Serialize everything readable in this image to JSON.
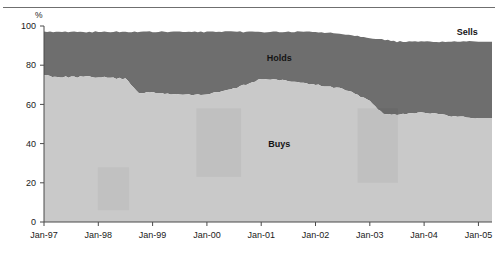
{
  "chart_data": {
    "type": "area",
    "stacked": true,
    "title": "",
    "subtitle": "",
    "xlabel": "",
    "ylabel": "",
    "yunit": "%",
    "ylim": [
      0,
      100
    ],
    "yticks": [
      0,
      20,
      40,
      60,
      80,
      100
    ],
    "ytick_labels": [
      "0",
      "20",
      "40",
      "60",
      "80",
      "100"
    ],
    "grid": false,
    "legend_position": "inline-annotations",
    "x": [
      "Jan-97",
      "Jul-97",
      "Jan-98",
      "Jul-98",
      "Jan-99",
      "Jul-99",
      "Jan-00",
      "Jul-00",
      "Jan-01",
      "Jul-01",
      "Jan-02",
      "Jul-02",
      "Jan-03",
      "Jul-03",
      "Jan-04",
      "Jul-04",
      "Jan-05"
    ],
    "xtick_labels": [
      "Jan-97",
      "Jan-98",
      "Jan-99",
      "Jan-00",
      "Jan-01",
      "Jan-02",
      "Jan-03",
      "Jan-04",
      "Jan-05"
    ],
    "series": [
      {
        "name": "Buys",
        "color": "#c9c9c9",
        "label": "Buys",
        "values": [
          75,
          74,
          74,
          73,
          66,
          65,
          65,
          68,
          73,
          72,
          70,
          68,
          62,
          55,
          56,
          54,
          53
        ]
      },
      {
        "name": "Holds",
        "color": "#6e6e6e",
        "label": "Holds",
        "values": [
          22,
          23,
          23,
          24,
          31,
          32,
          32,
          29,
          24,
          25,
          27,
          28,
          32,
          37,
          36,
          38,
          39
        ]
      },
      {
        "name": "Sells",
        "color": "#ffffff",
        "label": "Sells",
        "values": [
          3,
          3,
          3,
          3,
          3,
          3,
          3,
          3,
          3,
          3,
          3,
          4,
          6,
          8,
          8,
          8,
          8
        ]
      }
    ],
    "boundaries": {
      "buys_top": [
        {
          "x": "Jan-97",
          "y": 75
        },
        {
          "x": "Apr-97",
          "y": 74
        },
        {
          "x": "Jul-97",
          "y": 74
        },
        {
          "x": "Jan-98",
          "y": 74
        },
        {
          "x": "Jul-98",
          "y": 73
        },
        {
          "x": "Oct-98",
          "y": 66
        },
        {
          "x": "Jan-99",
          "y": 66
        },
        {
          "x": "Jul-99",
          "y": 65
        },
        {
          "x": "Jan-00",
          "y": 65
        },
        {
          "x": "Jul-00",
          "y": 68
        },
        {
          "x": "Jan-01",
          "y": 73
        },
        {
          "x": "Jul-01",
          "y": 72
        },
        {
          "x": "Jan-02",
          "y": 70
        },
        {
          "x": "Jul-02",
          "y": 68
        },
        {
          "x": "Jan-03",
          "y": 62
        },
        {
          "x": "Apr-03",
          "y": 55
        },
        {
          "x": "Jul-03",
          "y": 55
        },
        {
          "x": "Jan-04",
          "y": 56
        },
        {
          "x": "Jul-04",
          "y": 54
        },
        {
          "x": "Jan-05",
          "y": 53
        }
      ],
      "holds_top": [
        {
          "x": "Jan-97",
          "y": 97
        },
        {
          "x": "Jan-98",
          "y": 97
        },
        {
          "x": "Jan-99",
          "y": 97
        },
        {
          "x": "Jan-00",
          "y": 97
        },
        {
          "x": "Jan-01",
          "y": 97
        },
        {
          "x": "Jan-02",
          "y": 97
        },
        {
          "x": "Jul-02",
          "y": 96
        },
        {
          "x": "Jan-03",
          "y": 94
        },
        {
          "x": "Jul-03",
          "y": 92
        },
        {
          "x": "Jan-04",
          "y": 92
        },
        {
          "x": "Jan-05",
          "y": 92
        }
      ]
    },
    "annotations": [
      {
        "text": "Holds",
        "x_frac": 0.525,
        "y_value": 84
      },
      {
        "text": "Buys",
        "x_frac": 0.525,
        "y_value": 40
      },
      {
        "text": "Sells",
        "x_frac": 0.945,
        "y_value": 97
      }
    ]
  }
}
